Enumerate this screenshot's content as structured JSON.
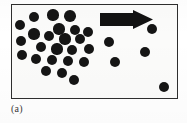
{
  "figure": {
    "caption": "(a)",
    "panel": {
      "background_color": "#fbfbfa",
      "border_color": "#2e2e2e",
      "x": 11,
      "y": 4,
      "width": 167,
      "height": 95
    }
  },
  "chart_data": {
    "type": "scatter",
    "title": "",
    "subtitle": "",
    "xlabel": "",
    "ylabel": "",
    "xlim": [
      0,
      167
    ],
    "ylim": [
      0,
      95
    ],
    "grid": false,
    "legend_position": "none",
    "annotations": [
      {
        "name": "flow-arrow",
        "shape": "block-arrow",
        "direction": "right",
        "color": "#121212",
        "x": 88,
        "y": 5,
        "width": 52,
        "height": 19
      },
      {
        "name": "panel-label",
        "text": "(a)",
        "x": 0,
        "y": 104
      }
    ],
    "series": [
      {
        "name": "particles",
        "marker": "circle",
        "marker_color": "#151515",
        "marker_diameter": 11,
        "count": 30,
        "points": [
          {
            "x": 8,
            "y": 20,
            "r": 5.2
          },
          {
            "x": 22,
            "y": 12,
            "r": 5.4
          },
          {
            "x": 41,
            "y": 10,
            "r": 5.6
          },
          {
            "x": 58,
            "y": 11,
            "r": 5.8
          },
          {
            "x": 47,
            "y": 24,
            "r": 5.6
          },
          {
            "x": 63,
            "y": 25,
            "r": 5.4
          },
          {
            "x": 76,
            "y": 27,
            "r": 5.2
          },
          {
            "x": 22,
            "y": 29,
            "r": 5.6
          },
          {
            "x": 37,
            "y": 31,
            "r": 5.0
          },
          {
            "x": 9,
            "y": 36,
            "r": 5.4
          },
          {
            "x": 53,
            "y": 34,
            "r": 5.6
          },
          {
            "x": 68,
            "y": 34,
            "r": 5.0
          },
          {
            "x": 29,
            "y": 42,
            "r": 5.4
          },
          {
            "x": 45,
            "y": 44,
            "r": 5.6
          },
          {
            "x": 60,
            "y": 45,
            "r": 5.2
          },
          {
            "x": 77,
            "y": 44,
            "r": 5.4
          },
          {
            "x": 10,
            "y": 50,
            "r": 5.2
          },
          {
            "x": 24,
            "y": 54,
            "r": 5.0
          },
          {
            "x": 40,
            "y": 55,
            "r": 5.4
          },
          {
            "x": 56,
            "y": 56,
            "r": 5.4
          },
          {
            "x": 72,
            "y": 57,
            "r": 5.2
          },
          {
            "x": 34,
            "y": 66,
            "r": 5.2
          },
          {
            "x": 50,
            "y": 68,
            "r": 5.0
          },
          {
            "x": 62,
            "y": 75,
            "r": 5.2
          },
          {
            "x": 97,
            "y": 37,
            "r": 5.4
          },
          {
            "x": 103,
            "y": 57,
            "r": 5.0
          },
          {
            "x": 121,
            "y": 15,
            "r": 5.2
          },
          {
            "x": 140,
            "y": 24,
            "r": 5.0
          },
          {
            "x": 133,
            "y": 47,
            "r": 5.2
          },
          {
            "x": 152,
            "y": 82,
            "r": 5.2
          }
        ]
      }
    ]
  }
}
